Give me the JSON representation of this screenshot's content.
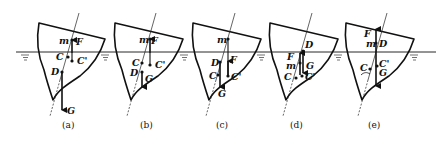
{
  "figure": {
    "colors": {
      "ink": "#111111",
      "background": "#ffffff"
    },
    "panels": [
      {
        "id": "a",
        "caption": "(a)",
        "labels": {
          "m": "m",
          "F": "F",
          "C": "C",
          "C_prime": "C'",
          "D": "D",
          "G": "G"
        }
      },
      {
        "id": "b",
        "caption": "(b)",
        "labels": {
          "m": "m",
          "F": "F",
          "C": "C",
          "C_prime": "C'",
          "D": "D",
          "G": "G"
        }
      },
      {
        "id": "c",
        "caption": "(c)",
        "labels": {
          "m": "m",
          "F": "F",
          "C": "C",
          "C_prime": "C'",
          "D": "D",
          "G": "G"
        }
      },
      {
        "id": "d",
        "caption": "(d)",
        "labels": {
          "m": "m",
          "F": "F",
          "C": "C",
          "C_prime": "C'",
          "D": "D",
          "G": "G"
        }
      },
      {
        "id": "e",
        "caption": "(e)",
        "labels": {
          "m": "m",
          "F": "F",
          "C": "C",
          "C_prime": "C'",
          "D": "D",
          "G": "G"
        }
      }
    ],
    "water_symbol": "water-surface-ripples"
  }
}
